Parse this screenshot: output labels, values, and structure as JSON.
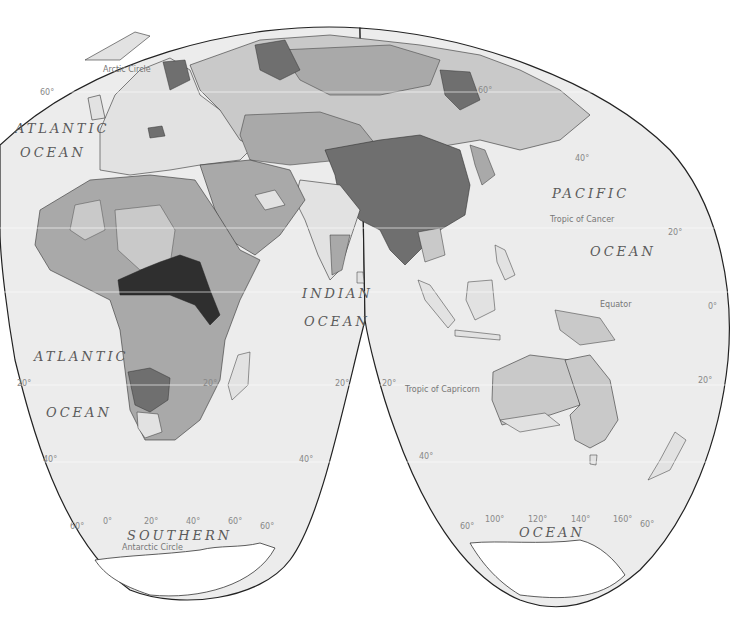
{
  "map": {
    "projection": "interrupted-homolosine",
    "colors": {
      "ocean": "#ececec",
      "outline": "#222222",
      "class_lightest": "#e2e2e2",
      "class_light": "#c9c9c9",
      "class_medium": "#a9a9a9",
      "class_dark": "#6f6f6f",
      "class_darkest": "#2f2f2f",
      "ice": "#ffffff"
    },
    "ocean_labels": [
      {
        "id": "atlantic-north-1",
        "text": "ATLANTIC"
      },
      {
        "id": "atlantic-north-2",
        "text": "OCEAN"
      },
      {
        "id": "pacific-1",
        "text": "PACIFIC"
      },
      {
        "id": "pacific-2",
        "text": "OCEAN"
      },
      {
        "id": "indian-1",
        "text": "INDIAN"
      },
      {
        "id": "indian-2",
        "text": "OCEAN"
      },
      {
        "id": "atlantic-south-1",
        "text": "ATLANTIC"
      },
      {
        "id": "atlantic-south-2",
        "text": "OCEAN"
      },
      {
        "id": "southern-1",
        "text": "SOUTHERN"
      },
      {
        "id": "southern-2",
        "text": "OCEAN"
      }
    ],
    "line_labels": {
      "arctic_circle": "Arctic Circle",
      "tropic_cancer": "Tropic of Cancer",
      "equator": "Equator",
      "tropic_capricorn": "Tropic of Capricorn",
      "antarctic_circle": "Antarctic Circle"
    },
    "latitude_labels": {
      "n60_left": "60°",
      "n60_right": "60°",
      "n40_right": "40°",
      "n20_right": "20°",
      "eq_right": "0°",
      "s20_left": "20°",
      "s20_mid1": "20°",
      "s20_mid2": "20°",
      "s20_mid3": "20°",
      "s20_right": "20°",
      "s40_left": "40°",
      "s40_mid": "40°",
      "s40_east": "40°",
      "s60_a": "60°",
      "s60_b": "60°",
      "s60_c": "60°",
      "s60_d": "60°"
    },
    "longitude_labels": {
      "lon0": "0°",
      "lon20": "20°",
      "lon40": "40°",
      "lon60": "60°",
      "lon100": "100°",
      "lon120": "120°",
      "lon140": "140°",
      "lon160": "160°"
    }
  }
}
